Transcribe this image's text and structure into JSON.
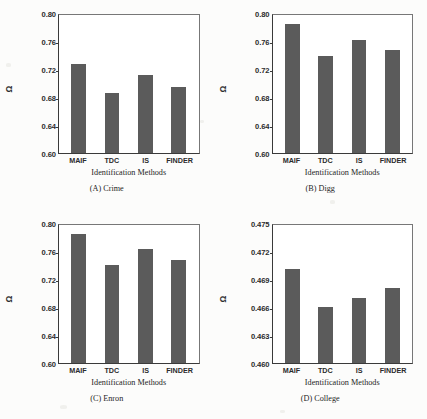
{
  "figure": {
    "background_color": "#fcfcfb",
    "bar_color": "#5b5b5b",
    "axis_color": "#3a3a3a",
    "omega_symbol": "Ω"
  },
  "chart_data": [
    {
      "type": "bar",
      "title": "(A) Crime",
      "panel_id": "A",
      "dataset": "Crime",
      "xlabel": "Identification Methods",
      "ylabel": "Ω",
      "categories": [
        "MAIF",
        "TDC",
        "IS",
        "FINDER"
      ],
      "values": [
        0.727,
        0.686,
        0.712,
        0.695
      ],
      "ylim": [
        0.6,
        0.8
      ],
      "yticks": [
        0.8,
        0.76,
        0.72,
        0.68,
        0.64,
        0.6
      ],
      "ytick_labels": [
        "0.80",
        "0.76",
        "0.72",
        "0.68",
        "0.64",
        "0.60"
      ],
      "grid": false,
      "legend": null
    },
    {
      "type": "bar",
      "title": "(B) Digg",
      "panel_id": "B",
      "dataset": "Digg",
      "xlabel": "Identification Methods",
      "ylabel": "Ω",
      "categories": [
        "MAIF",
        "TDC",
        "IS",
        "FINDER"
      ],
      "values": [
        0.784,
        0.739,
        0.761,
        0.747
      ],
      "ylim": [
        0.6,
        0.8
      ],
      "yticks": [
        0.8,
        0.76,
        0.72,
        0.68,
        0.64,
        0.6
      ],
      "ytick_labels": [
        "0.80",
        "0.76",
        "0.72",
        "0.68",
        "0.64",
        "0.60"
      ],
      "grid": false,
      "legend": null
    },
    {
      "type": "bar",
      "title": "(C) Enron",
      "panel_id": "C",
      "dataset": "Enron",
      "xlabel": "Identification Methods",
      "ylabel": "Ω",
      "categories": [
        "MAIF",
        "TDC",
        "IS",
        "FINDER"
      ],
      "values": [
        0.784,
        0.739,
        0.762,
        0.747
      ],
      "ylim": [
        0.6,
        0.8
      ],
      "yticks": [
        0.8,
        0.76,
        0.72,
        0.68,
        0.64,
        0.6
      ],
      "ytick_labels": [
        "0.80",
        "0.76",
        "0.72",
        "0.68",
        "0.64",
        "0.60"
      ],
      "grid": false,
      "legend": null
    },
    {
      "type": "bar",
      "title": "(D) College",
      "panel_id": "D",
      "dataset": "College",
      "xlabel": "Identification Methods",
      "ylabel": "Ω",
      "categories": [
        "MAIF",
        "TDC",
        "IS",
        "FINDER"
      ],
      "values": [
        0.47,
        0.4659,
        0.4669,
        0.468
      ],
      "ylim": [
        0.46,
        0.475
      ],
      "yticks": [
        0.475,
        0.472,
        0.469,
        0.466,
        0.463,
        0.46
      ],
      "ytick_labels": [
        "0.475",
        "0.472",
        "0.469",
        "0.466",
        "0.463",
        "0.460"
      ],
      "grid": false,
      "legend": null
    }
  ]
}
